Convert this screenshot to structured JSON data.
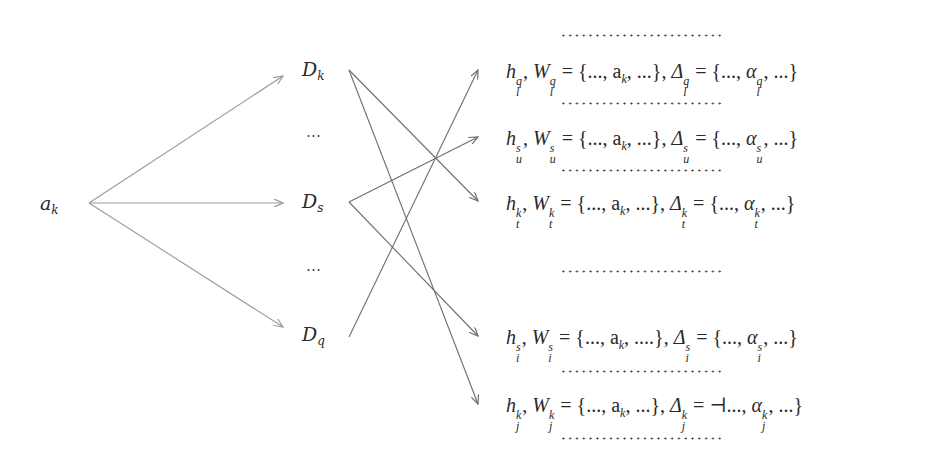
{
  "diagram": {
    "source": {
      "base": "a",
      "sub": "k"
    },
    "middle_nodes": [
      {
        "id": "Dk",
        "base": "D",
        "sub": "k"
      },
      {
        "id": "Ds",
        "base": "D",
        "sub": "s"
      },
      {
        "id": "Dq",
        "base": "D",
        "sub": "q"
      }
    ],
    "middle_ellipsis": "⋯",
    "rows": [
      {
        "id": "l",
        "h": "h",
        "W": "W",
        "sup": "q",
        "sub": "l",
        "set_W": "{..., a",
        "set_W_sub": "k",
        "set_W_tail": ", ...}",
        "Delta": "Δ",
        "set_D_open": "{...,",
        "alpha": "α",
        "set_D_tail": ", ...}"
      },
      {
        "id": "u",
        "h": "h",
        "W": "W",
        "sup": "s",
        "sub": "u",
        "set_W": "{..., a",
        "set_W_sub": "k",
        "set_W_tail": ", ...}",
        "Delta": "Δ",
        "set_D_open": "{...,",
        "alpha": "α",
        "set_D_tail": ", ...}"
      },
      {
        "id": "t",
        "h": "h",
        "W": "W",
        "sup": "k",
        "sub": "t",
        "set_W": "{..., a",
        "set_W_sub": "k",
        "set_W_tail": ", ...}",
        "Delta": "Δ",
        "set_D_open": "{...,",
        "alpha": "α",
        "set_D_tail": ", ...}"
      },
      {
        "id": "i",
        "h": "h",
        "W": "W",
        "sup": "s",
        "sub": "i",
        "set_W": "{..., a",
        "set_W_sub": "k",
        "set_W_tail": ", ....}",
        "Delta": "Δ",
        "set_D_open": "{...,",
        "alpha": "α",
        "set_D_tail": ", ...}"
      },
      {
        "id": "j",
        "h": "h",
        "W": "W",
        "sup": "k",
        "sub": "j",
        "set_W": "{..., a",
        "set_W_sub": "k",
        "set_W_tail": ", ...}",
        "Delta": "Δ",
        "set_D_open": "⊣...,",
        "alpha": "α",
        "set_D_tail": ", ...}"
      }
    ],
    "edges": [
      {
        "from": "a_k",
        "to": "D_k"
      },
      {
        "from": "a_k",
        "to": "D_s"
      },
      {
        "from": "a_k",
        "to": "D_q"
      },
      {
        "from": "D_k",
        "to": "h_t^k"
      },
      {
        "from": "D_k",
        "to": "h_j^k"
      },
      {
        "from": "D_s",
        "to": "h_u^s"
      },
      {
        "from": "D_s",
        "to": "h_i^s"
      },
      {
        "from": "D_q",
        "to": "h_l^q"
      }
    ],
    "colors": {
      "edge_source": "#9a9a9a",
      "edge_mid": "#6e6e6e",
      "text": "#2a2a2a"
    }
  }
}
